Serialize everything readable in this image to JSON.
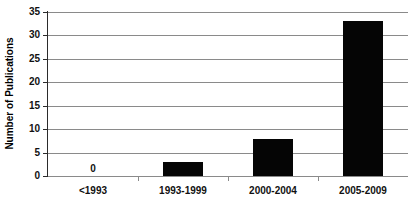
{
  "chart_data": {
    "type": "bar",
    "title": "",
    "subtitle": "",
    "xlabel": "",
    "ylabel": "Number of Publications",
    "categories": [
      "<1993",
      "1993-1999",
      "2000-2004",
      "2005-2009"
    ],
    "values": [
      0,
      3,
      8,
      33
    ],
    "value_labels": [
      "0",
      "",
      "",
      ""
    ],
    "ylim": [
      0,
      35
    ],
    "ytick_labels": [
      "0",
      "5",
      "10",
      "15",
      "20",
      "25",
      "30",
      "35"
    ],
    "yticks": [
      0,
      5,
      10,
      15,
      20,
      25,
      30,
      35
    ],
    "grid": true,
    "grid_axis": "y",
    "legend": false,
    "legend_position": "none",
    "series": [
      {
        "name": "Publications",
        "values": [
          0,
          3,
          8,
          33
        ],
        "color": "#050505"
      }
    ],
    "colors": {
      "bar": "#050505",
      "gridline": "#8a8a8a",
      "axis": "#2b2b2b",
      "text": "#111111",
      "background": "#ffffff"
    }
  },
  "axis": {
    "y_title": "Number of Publications",
    "y_ticks": [
      {
        "label": "35",
        "value": 35
      },
      {
        "label": "30",
        "value": 30
      },
      {
        "label": "25",
        "value": 25
      },
      {
        "label": "20",
        "value": 20
      },
      {
        "label": "15",
        "value": 15
      },
      {
        "label": "10",
        "value": 10
      },
      {
        "label": "5",
        "value": 5
      },
      {
        "label": "0",
        "value": 0
      }
    ],
    "x_categories": [
      {
        "label": "<1993"
      },
      {
        "label": "1993-1999"
      },
      {
        "label": "2000-2004"
      },
      {
        "label": "2005-2009"
      }
    ]
  }
}
